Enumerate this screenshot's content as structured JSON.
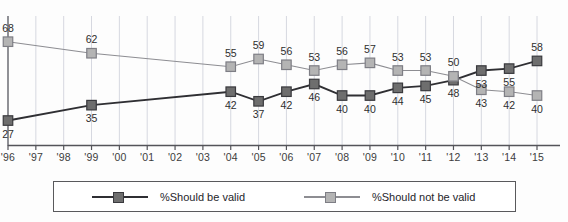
{
  "chart_data": {
    "type": "line",
    "title": "",
    "subtitle": "",
    "xlabel": "",
    "ylabel": "",
    "grid": true,
    "legend_position": "bottom",
    "axis_tick_labels": [
      "'96",
      "'97",
      "'98",
      "'99",
      "'00",
      "'01",
      "'02",
      "'03",
      "'04",
      "'05",
      "'06",
      "'07",
      "'08",
      "'09",
      "'10",
      "'11",
      "'12",
      "'13",
      "'14",
      "'15"
    ],
    "x": [
      "'96",
      "'99",
      "'04",
      "'05",
      "'06",
      "'07",
      "'08",
      "'09",
      "'10",
      "'11",
      "'12",
      "'13",
      "'14",
      "'15"
    ],
    "ylim": [
      20,
      72
    ],
    "series": [
      {
        "name": "%Should be valid",
        "color": "#6e6e6e",
        "line_color": "#2f2f33",
        "values": [
          27,
          35,
          42,
          37,
          42,
          46,
          40,
          40,
          44,
          45,
          48,
          53,
          54,
          58
        ],
        "label_side": [
          "below",
          "below",
          "below",
          "below",
          "below",
          "below",
          "below",
          "below",
          "below",
          "below",
          "below",
          "below",
          "below",
          "above"
        ]
      },
      {
        "name": "%Should not be valid",
        "color": "#b4b4b4",
        "line_color": "#8d8d92",
        "values": [
          68,
          62,
          55,
          59,
          56,
          53,
          56,
          57,
          53,
          53,
          50,
          43,
          42,
          40
        ],
        "label_side": [
          "above",
          "above",
          "above",
          "above",
          "above",
          "above",
          "above",
          "above",
          "above",
          "above",
          "above",
          "below",
          "below",
          "below"
        ]
      }
    ],
    "point_labels_series_0": [
      "27",
      "35",
      "42",
      "37",
      "42",
      "46",
      "40",
      "40",
      "44",
      "45",
      "48",
      "53",
      "55",
      "58"
    ],
    "point_labels_series_1": [
      "68",
      "62",
      "55",
      "59",
      "56",
      "53",
      "56",
      "57",
      "53",
      "53",
      "50",
      "43",
      "42",
      "40"
    ]
  },
  "legend": {
    "items": [
      {
        "label": "%Should be valid",
        "color": "#6e6e6e",
        "line_color": "#2f2f33"
      },
      {
        "label": "%Should not be valid",
        "color": "#b4b4b4",
        "line_color": "#8d8d92"
      }
    ]
  },
  "colors": {
    "grid": "#d6d8e0",
    "axis": "#54545a",
    "text": "#2e2e2e",
    "background": "#fdfdfd"
  }
}
